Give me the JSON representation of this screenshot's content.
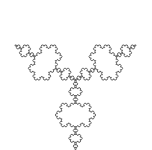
{
  "figure": {
    "title": "Koch snowflake",
    "type": "fractal",
    "iterations": 4,
    "stroke_color": "#555555",
    "background_color": "#ffffff"
  }
}
